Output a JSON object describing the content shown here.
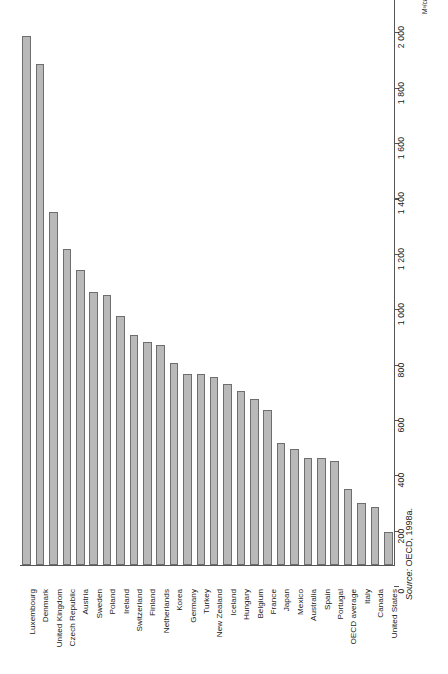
{
  "chart_data": {
    "type": "bar",
    "orientation": "vertical",
    "title": "",
    "subtitle": "",
    "xlabel": "",
    "ylabel": "M³/capita/year",
    "ylim": [
      0,
      2000
    ],
    "grid": false,
    "legend": null,
    "axis_unit": "M³/capita/year",
    "tick_labels": [
      "0",
      "200",
      "400",
      "600",
      "800",
      "1 000",
      "1 200",
      "1 400",
      "1 600",
      "1 800",
      "2 000"
    ],
    "tick_values": [
      0,
      200,
      400,
      600,
      800,
      1000,
      1200,
      1400,
      1600,
      1800,
      2000
    ],
    "categories": [
      "Luxembourg",
      "Denmark",
      "United Kingdom",
      "Czech Republic",
      "Austria",
      "Sweden",
      "Poland",
      "Ireland",
      "Switzerland",
      "Finland",
      "Netherlands",
      "Korea",
      "Germany",
      "Turkey",
      "New Zealand",
      "Iceland",
      "Hungary",
      "Belgium",
      "France",
      "Japan",
      "Mexico",
      "Australia",
      "Spain",
      "Portugal",
      "OECD average",
      "Italy",
      "Canada",
      "United States"
    ],
    "values": [
      120,
      210,
      225,
      275,
      375,
      385,
      385,
      420,
      440,
      560,
      600,
      630,
      655,
      680,
      690,
      690,
      730,
      795,
      805,
      830,
      900,
      975,
      985,
      1065,
      1140,
      1275,
      1810,
      1910
    ],
    "series_color": "#b9b9b9",
    "series_edge_color": "#6e6e6e"
  },
  "source": {
    "prefix": "Source:",
    "text": "OECD, 1998a."
  }
}
